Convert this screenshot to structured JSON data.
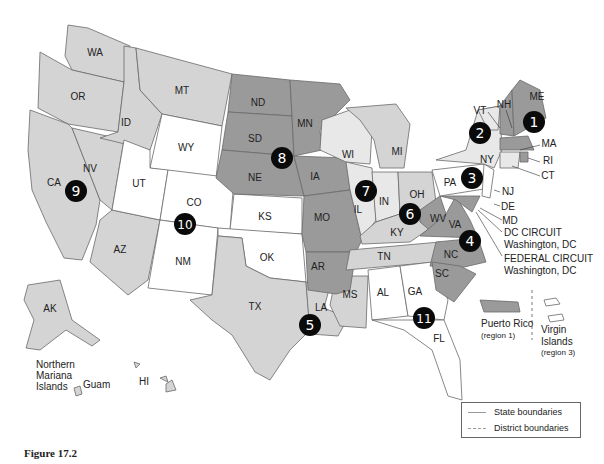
{
  "map": {
    "title": "U.S. Federal Court Circuits and District Boundaries",
    "states": {
      "WA": "WA",
      "OR": "OR",
      "CA": "CA",
      "NV": "NV",
      "ID": "ID",
      "MT": "MT",
      "WY": "WY",
      "UT": "UT",
      "CO": "CO",
      "AZ": "AZ",
      "NM": "NM",
      "ND": "ND",
      "SD": "SD",
      "NE": "NE",
      "KS": "KS",
      "OK": "OK",
      "TX": "TX",
      "MN": "MN",
      "IA": "IA",
      "MO": "MO",
      "AR": "AR",
      "LA": "LA",
      "WI": "WI",
      "IL": "IL",
      "IN": "IN",
      "MI": "MI",
      "OH": "OH",
      "KY": "KY",
      "TN": "TN",
      "MS": "MS",
      "AL": "AL",
      "GA": "GA",
      "FL": "FL",
      "SC": "SC",
      "NC": "NC",
      "VA": "VA",
      "WV": "WV",
      "PA": "PA",
      "NY": "NY",
      "VT": "VT",
      "NH": "NH",
      "ME": "ME",
      "MA": "MA",
      "RI": "RI",
      "CT": "CT",
      "NJ": "NJ",
      "DE": "DE",
      "MD": "MD",
      "AK": "AK",
      "HI": "HI"
    },
    "circuits": [
      "1",
      "2",
      "3",
      "4",
      "5",
      "6",
      "7",
      "8",
      "9",
      "10",
      "11"
    ],
    "annotations": {
      "dc_circuit_line1": "DC CIRCUIT",
      "dc_circuit_line2": "Washington, DC",
      "federal_circuit_line1": "FEDERAL CIRCUIT",
      "federal_circuit_line2": "Washington, DC",
      "puerto_rico": "Puerto Rico",
      "puerto_rico_region": "(region 1)",
      "virgin_islands_1": "Virgin",
      "virgin_islands_2": "Islands",
      "virgin_islands_region": "(region 3)",
      "nmi_1": "Northern",
      "nmi_2": "Mariana",
      "nmi_3": "Islands",
      "guam": "Guam"
    },
    "districts": {
      "western": "Western",
      "eastern": "Eastern",
      "northern": "Northern",
      "southern": "Southern",
      "central": "Central",
      "middle": "Middle"
    }
  },
  "legend": {
    "state_boundaries": "State boundaries",
    "district_boundaries": "District boundaries"
  },
  "caption": "Figure 17.2",
  "colors": {
    "light_gray": "#d4d4d4",
    "dark_gray": "#9a9a9a",
    "pale_gray": "#e8e8e8",
    "white": "#ffffff",
    "circle": "#0a0a0a"
  }
}
